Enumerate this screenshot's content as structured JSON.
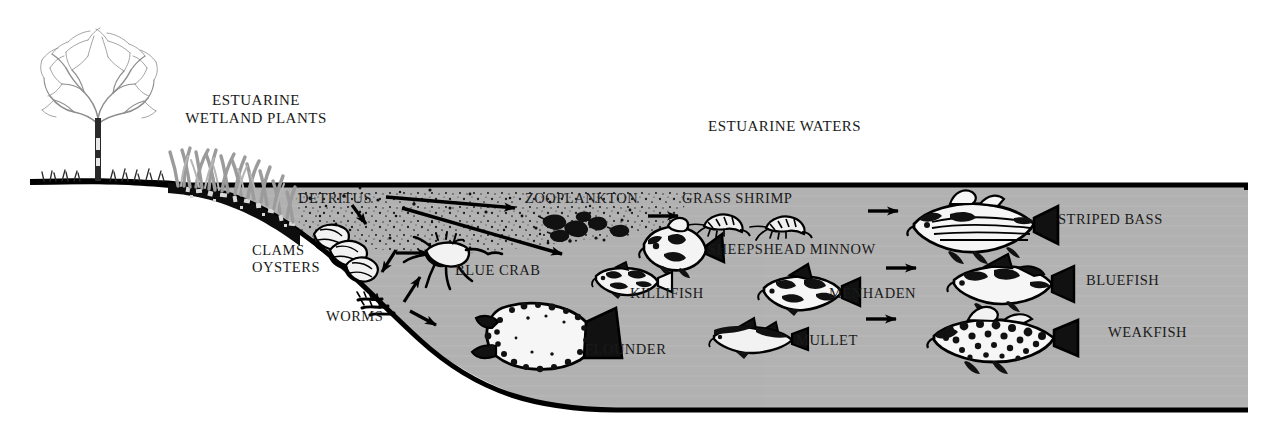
{
  "diagram": {
    "type": "ecological-cross-section-diagram",
    "colors": {
      "background": "#ffffff",
      "water": "#b2b2b2",
      "outline": "#000000",
      "text": "#1a1a1a",
      "vegetation": "#9a9a9a"
    }
  },
  "headings": {
    "wetland_line1": "ESTUARINE",
    "wetland_line2": "WETLAND PLANTS",
    "waters": "ESTUARINE WATERS"
  },
  "labels": {
    "detritus": "DETRITUS",
    "clams": "CLAMS",
    "oysters": "OYSTERS",
    "worms": "WORMS",
    "blue_crab": "BLUE CRAB",
    "zooplankton": "ZOOPLANKTON",
    "grass_shrimp": "GRASS SHRIMP",
    "sheepshead_minnow": "SHEEPSHEAD MINNOW",
    "killifish": "KILLIFISH",
    "flounder": "FLOUNDER",
    "menhaden": "MENHADEN",
    "mullet": "MULLET",
    "striped_bass": "STRIPED BASS",
    "bluefish": "BLUEFISH",
    "weakfish": "WEAKFISH"
  },
  "organisms": [
    {
      "name": "tree",
      "label": null,
      "zone": "upland"
    },
    {
      "name": "marsh-grass",
      "label": null,
      "zone": "wetland"
    },
    {
      "name": "detritus-particles",
      "label": "DETRITUS",
      "zone": "benthic"
    },
    {
      "name": "clams-oysters",
      "label": "CLAMS OYSTERS",
      "zone": "benthic"
    },
    {
      "name": "worms",
      "label": "WORMS",
      "zone": "benthic"
    },
    {
      "name": "blue-crab",
      "label": "BLUE CRAB",
      "zone": "benthic"
    },
    {
      "name": "zooplankton",
      "label": "ZOOPLANKTON",
      "zone": "pelagic"
    },
    {
      "name": "grass-shrimp",
      "label": "GRASS SHRIMP",
      "zone": "pelagic"
    },
    {
      "name": "sheepshead-minnow",
      "label": "SHEEPSHEAD MINNOW",
      "zone": "pelagic"
    },
    {
      "name": "killifish",
      "label": "KILLIFISH",
      "zone": "pelagic"
    },
    {
      "name": "flounder",
      "label": "FLOUNDER",
      "zone": "benthic"
    },
    {
      "name": "menhaden",
      "label": "MENHADEN",
      "zone": "pelagic"
    },
    {
      "name": "mullet",
      "label": "MULLET",
      "zone": "pelagic"
    },
    {
      "name": "striped-bass",
      "label": "STRIPED BASS",
      "zone": "pelagic"
    },
    {
      "name": "bluefish",
      "label": "BLUEFISH",
      "zone": "pelagic"
    },
    {
      "name": "weakfish",
      "label": "WEAKFISH",
      "zone": "pelagic"
    }
  ],
  "flows": [
    {
      "from": "DETRITUS",
      "to": "ZOOPLANKTON"
    },
    {
      "from": "DETRITUS",
      "to": "CLAMS OYSTERS"
    },
    {
      "from": "DETRITUS",
      "to": "WORMS"
    },
    {
      "from": "DETRITUS",
      "to": "FLOUNDER"
    },
    {
      "from": "CLAMS OYSTERS",
      "to": "BLUE CRAB"
    },
    {
      "from": "WORMS",
      "to": "BLUE CRAB"
    },
    {
      "from": "ZOOPLANKTON",
      "to": "GRASS SHRIMP"
    },
    {
      "from": "SHEEPSHEAD MINNOW",
      "to": "STRIPED BASS"
    },
    {
      "from": "MENHADEN",
      "to": "BLUEFISH"
    },
    {
      "from": "MULLET",
      "to": "WEAKFISH"
    }
  ]
}
